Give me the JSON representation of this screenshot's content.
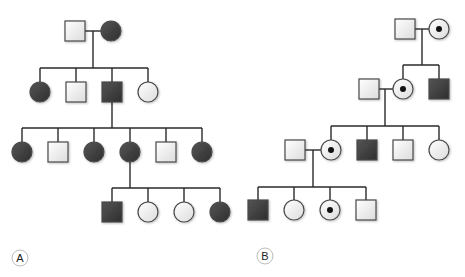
{
  "figure": {
    "width": 465,
    "height": 277,
    "symbol_size": 20,
    "colors": {
      "line": "#2a2a2a",
      "affected_fill": "#3c3c3c",
      "unaffected_fill": "#f4f4f4",
      "symbol_stroke": "#4a4a4a",
      "carrier_dot": "#111111",
      "label_circle": "#bdbdbd",
      "label_text": "#222222"
    }
  },
  "pedigrees": [
    {
      "id": "A",
      "label": "A",
      "label_pos": [
        20,
        258
      ],
      "individuals": [
        {
          "id": "A-I-1",
          "gen": "I",
          "sex": "male",
          "status": "unaffected",
          "x": 75,
          "y": 31
        },
        {
          "id": "A-I-2",
          "gen": "I",
          "sex": "female",
          "status": "affected",
          "x": 111,
          "y": 31
        },
        {
          "id": "A-II-1",
          "gen": "II",
          "sex": "female",
          "status": "affected",
          "x": 40,
          "y": 92
        },
        {
          "id": "A-II-2",
          "gen": "II",
          "sex": "male",
          "status": "unaffected",
          "x": 76,
          "y": 92
        },
        {
          "id": "A-II-3",
          "gen": "II",
          "sex": "male",
          "status": "affected",
          "x": 112,
          "y": 92
        },
        {
          "id": "A-II-4",
          "gen": "II",
          "sex": "female",
          "status": "unaffected",
          "x": 148,
          "y": 92
        },
        {
          "id": "A-III-1",
          "gen": "III",
          "sex": "female",
          "status": "affected",
          "x": 22,
          "y": 152
        },
        {
          "id": "A-III-2",
          "gen": "III",
          "sex": "male",
          "status": "unaffected",
          "x": 58,
          "y": 152
        },
        {
          "id": "A-III-3",
          "gen": "III",
          "sex": "female",
          "status": "affected",
          "x": 94,
          "y": 152
        },
        {
          "id": "A-III-4",
          "gen": "III",
          "sex": "female",
          "status": "affected",
          "x": 130,
          "y": 152
        },
        {
          "id": "A-III-5",
          "gen": "III",
          "sex": "male",
          "status": "unaffected",
          "x": 166,
          "y": 152
        },
        {
          "id": "A-III-6",
          "gen": "III",
          "sex": "female",
          "status": "affected",
          "x": 202,
          "y": 152
        },
        {
          "id": "A-IV-1",
          "gen": "IV",
          "sex": "male",
          "status": "affected",
          "x": 112,
          "y": 212
        },
        {
          "id": "A-IV-2",
          "gen": "IV",
          "sex": "female",
          "status": "unaffected",
          "x": 148,
          "y": 212
        },
        {
          "id": "A-IV-3",
          "gen": "IV",
          "sex": "female",
          "status": "unaffected",
          "x": 184,
          "y": 212
        },
        {
          "id": "A-IV-4",
          "gen": "IV",
          "sex": "female",
          "status": "affected",
          "x": 220,
          "y": 212
        }
      ],
      "lines": [
        {
          "kind": "mating",
          "from": [
            85,
            31
          ],
          "to": [
            101,
            31
          ]
        },
        {
          "kind": "descent",
          "from": [
            93,
            31
          ],
          "to": [
            93,
            68
          ]
        },
        {
          "kind": "sibship",
          "from": [
            40,
            68
          ],
          "to": [
            148,
            68
          ]
        },
        {
          "kind": "drop",
          "from": [
            40,
            68
          ],
          "to": [
            40,
            82
          ]
        },
        {
          "kind": "drop",
          "from": [
            76,
            68
          ],
          "to": [
            76,
            82
          ]
        },
        {
          "kind": "drop",
          "from": [
            112,
            68
          ],
          "to": [
            112,
            82
          ]
        },
        {
          "kind": "drop",
          "from": [
            148,
            68
          ],
          "to": [
            148,
            82
          ]
        },
        {
          "kind": "descent",
          "from": [
            112,
            102
          ],
          "to": [
            112,
            128
          ]
        },
        {
          "kind": "sibship",
          "from": [
            22,
            128
          ],
          "to": [
            202,
            128
          ]
        },
        {
          "kind": "drop",
          "from": [
            22,
            128
          ],
          "to": [
            22,
            142
          ]
        },
        {
          "kind": "drop",
          "from": [
            58,
            128
          ],
          "to": [
            58,
            142
          ]
        },
        {
          "kind": "drop",
          "from": [
            94,
            128
          ],
          "to": [
            94,
            142
          ]
        },
        {
          "kind": "drop",
          "from": [
            130,
            128
          ],
          "to": [
            130,
            142
          ]
        },
        {
          "kind": "drop",
          "from": [
            166,
            128
          ],
          "to": [
            166,
            142
          ]
        },
        {
          "kind": "drop",
          "from": [
            202,
            128
          ],
          "to": [
            202,
            142
          ]
        },
        {
          "kind": "descent",
          "from": [
            130,
            162
          ],
          "to": [
            130,
            188
          ]
        },
        {
          "kind": "sibship",
          "from": [
            112,
            188
          ],
          "to": [
            220,
            188
          ]
        },
        {
          "kind": "drop",
          "from": [
            112,
            188
          ],
          "to": [
            112,
            202
          ]
        },
        {
          "kind": "drop",
          "from": [
            148,
            188
          ],
          "to": [
            148,
            202
          ]
        },
        {
          "kind": "drop",
          "from": [
            184,
            188
          ],
          "to": [
            184,
            202
          ]
        },
        {
          "kind": "drop",
          "from": [
            220,
            188
          ],
          "to": [
            220,
            202
          ]
        }
      ]
    },
    {
      "id": "B",
      "label": "B",
      "label_pos": [
        265,
        256
      ],
      "individuals": [
        {
          "id": "B-I-1",
          "gen": "I",
          "sex": "male",
          "status": "unaffected",
          "x": 405,
          "y": 29
        },
        {
          "id": "B-I-2",
          "gen": "I",
          "sex": "female",
          "status": "carrier",
          "x": 439,
          "y": 29
        },
        {
          "id": "B-II-spouse",
          "gen": "II",
          "sex": "male",
          "status": "unaffected",
          "x": 369,
          "y": 89
        },
        {
          "id": "B-II-1",
          "gen": "II",
          "sex": "female",
          "status": "carrier",
          "x": 403,
          "y": 89
        },
        {
          "id": "B-II-2",
          "gen": "II",
          "sex": "male",
          "status": "affected",
          "x": 439,
          "y": 89
        },
        {
          "id": "B-III-spouse",
          "gen": "III",
          "sex": "male",
          "status": "unaffected",
          "x": 295,
          "y": 150
        },
        {
          "id": "B-III-1",
          "gen": "III",
          "sex": "female",
          "status": "carrier",
          "x": 331,
          "y": 150
        },
        {
          "id": "B-III-2",
          "gen": "III",
          "sex": "male",
          "status": "affected",
          "x": 367,
          "y": 150
        },
        {
          "id": "B-III-3",
          "gen": "III",
          "sex": "male",
          "status": "unaffected",
          "x": 403,
          "y": 150
        },
        {
          "id": "B-III-4",
          "gen": "III",
          "sex": "female",
          "status": "unaffected",
          "x": 439,
          "y": 150
        },
        {
          "id": "B-IV-1",
          "gen": "IV",
          "sex": "male",
          "status": "affected",
          "x": 258,
          "y": 210
        },
        {
          "id": "B-IV-2",
          "gen": "IV",
          "sex": "female",
          "status": "unaffected",
          "x": 294,
          "y": 210
        },
        {
          "id": "B-IV-3",
          "gen": "IV",
          "sex": "female",
          "status": "carrier",
          "x": 330,
          "y": 210
        },
        {
          "id": "B-IV-4",
          "gen": "IV",
          "sex": "male",
          "status": "unaffected",
          "x": 366,
          "y": 210
        }
      ],
      "lines": [
        {
          "kind": "mating",
          "from": [
            415,
            29
          ],
          "to": [
            429,
            29
          ]
        },
        {
          "kind": "descent",
          "from": [
            422,
            29
          ],
          "to": [
            422,
            65
          ]
        },
        {
          "kind": "sibship",
          "from": [
            403,
            65
          ],
          "to": [
            439,
            65
          ]
        },
        {
          "kind": "drop",
          "from": [
            403,
            65
          ],
          "to": [
            403,
            79
          ]
        },
        {
          "kind": "drop",
          "from": [
            439,
            65
          ],
          "to": [
            439,
            79
          ]
        },
        {
          "kind": "mating",
          "from": [
            379,
            89
          ],
          "to": [
            393,
            89
          ]
        },
        {
          "kind": "descent",
          "from": [
            385,
            89
          ],
          "to": [
            385,
            126
          ]
        },
        {
          "kind": "sibship",
          "from": [
            331,
            126
          ],
          "to": [
            439,
            126
          ]
        },
        {
          "kind": "drop",
          "from": [
            331,
            126
          ],
          "to": [
            331,
            140
          ]
        },
        {
          "kind": "drop",
          "from": [
            367,
            126
          ],
          "to": [
            367,
            140
          ]
        },
        {
          "kind": "drop",
          "from": [
            403,
            126
          ],
          "to": [
            403,
            140
          ]
        },
        {
          "kind": "drop",
          "from": [
            439,
            126
          ],
          "to": [
            439,
            140
          ]
        },
        {
          "kind": "mating",
          "from": [
            305,
            150
          ],
          "to": [
            321,
            150
          ]
        },
        {
          "kind": "descent",
          "from": [
            313,
            150
          ],
          "to": [
            313,
            187
          ]
        },
        {
          "kind": "sibship",
          "from": [
            258,
            187
          ],
          "to": [
            366,
            187
          ]
        },
        {
          "kind": "drop",
          "from": [
            258,
            187
          ],
          "to": [
            258,
            200
          ]
        },
        {
          "kind": "drop",
          "from": [
            294,
            187
          ],
          "to": [
            294,
            200
          ]
        },
        {
          "kind": "drop",
          "from": [
            330,
            187
          ],
          "to": [
            330,
            200
          ]
        },
        {
          "kind": "drop",
          "from": [
            366,
            187
          ],
          "to": [
            366,
            200
          ]
        }
      ]
    }
  ],
  "legend": {
    "symbols": {
      "square": "male",
      "circle": "female",
      "filled": "affected",
      "open": "unaffected",
      "dotted-circle": "carrier female"
    }
  }
}
